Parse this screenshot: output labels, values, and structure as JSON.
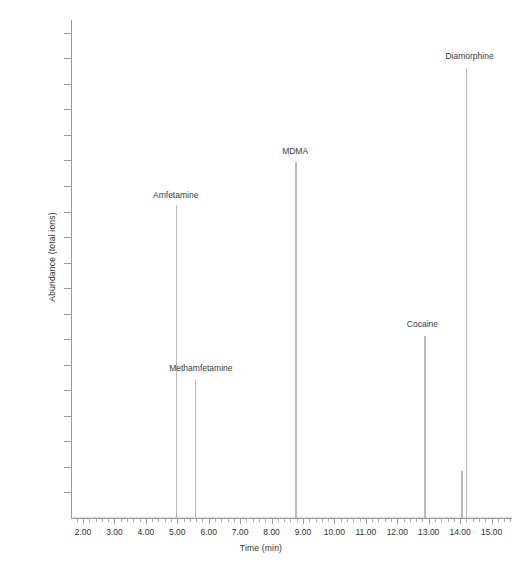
{
  "chart_data": {
    "type": "bar",
    "title": "",
    "xlabel": "Time (min)",
    "ylabel": "Abundance (total ions)",
    "xlim": [
      1.65,
      15.65
    ],
    "ylim": [
      0,
      975000
    ],
    "grid": false,
    "legend": "none",
    "x_ticks": [
      "2.00",
      "3.00",
      "4.00",
      "5.00",
      "6.00",
      "7.00",
      "8.00",
      "9.00",
      "10.00",
      "11.00",
      "12.00",
      "13.00",
      "14.00",
      "15.00"
    ],
    "x_tick_values": [
      2,
      3,
      4,
      5,
      6,
      7,
      8,
      9,
      10,
      11,
      12,
      13,
      14,
      15
    ],
    "y_ticks": [
      "50000",
      "100000",
      "150000",
      "200000",
      "250000",
      "300000",
      "350000",
      "400000",
      "450000",
      "500000",
      "550000",
      "600000",
      "650000",
      "700000",
      "750000",
      "800000",
      "850000",
      "900000",
      "950000"
    ],
    "y_tick_values": [
      50000,
      100000,
      150000,
      200000,
      250000,
      300000,
      350000,
      400000,
      450000,
      500000,
      550000,
      600000,
      650000,
      700000,
      750000,
      800000,
      850000,
      900000,
      950000
    ],
    "minor_x_ticks_per_interval": 5,
    "peaks": [
      {
        "label": "Amfetamine",
        "retention_time": 4.95,
        "abundance": 612000,
        "labeled": true,
        "label_x": 4.95,
        "label_y": 630000
      },
      {
        "label": "Methamfetamine",
        "retention_time": 5.55,
        "abundance": 272000,
        "labeled": true,
        "label_x": 5.75,
        "label_y": 292000
      },
      {
        "label": "MDMA",
        "retention_time": 8.75,
        "abundance": 697000,
        "labeled": true,
        "label_x": 8.75,
        "label_y": 717000
      },
      {
        "label": "Cocaine",
        "retention_time": 12.85,
        "abundance": 357000,
        "labeled": true,
        "label_x": 12.8,
        "label_y": 377000
      },
      {
        "label": "",
        "retention_time": 14.03,
        "abundance": 92000,
        "labeled": false,
        "label_x": 0,
        "label_y": 0
      },
      {
        "label": "Diamorphine",
        "retention_time": 14.18,
        "abundance": 880000,
        "labeled": true,
        "label_x": 14.3,
        "label_y": 903000
      }
    ],
    "colors": {
      "trace": "#b9b9b9",
      "axis": "#9a9a9a",
      "text": "#3a3a3a",
      "background": "#ffffff"
    }
  }
}
